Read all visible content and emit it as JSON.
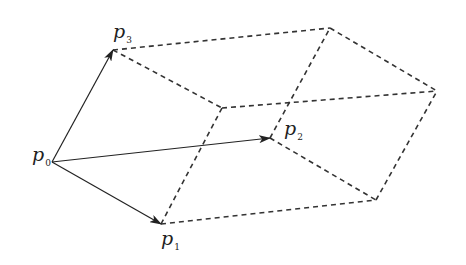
{
  "diagram": {
    "title": "",
    "colors": {
      "line": "#222222",
      "dashed": "#333333",
      "background": "#ffffff"
    },
    "points": {
      "p0": {
        "x": 52,
        "y": 162
      },
      "p1": {
        "x": 161,
        "y": 224
      },
      "p2": {
        "x": 270,
        "y": 138
      },
      "p3": {
        "x": 113,
        "y": 50
      },
      "p1p3": {
        "x": 222,
        "y": 108
      },
      "p2p3": {
        "x": 330,
        "y": 28
      },
      "p1p2p3": {
        "x": 437,
        "y": 91
      },
      "p1p2": {
        "x": 376,
        "y": 200
      }
    },
    "labels": [
      {
        "id": "p0",
        "base": "p",
        "sub": "0",
        "x": 32,
        "y": 145
      },
      {
        "id": "p1",
        "base": "p",
        "sub": "1",
        "x": 161,
        "y": 229
      },
      {
        "id": "p2",
        "base": "p",
        "sub": "2",
        "x": 284,
        "y": 119
      },
      {
        "id": "p3",
        "base": "p",
        "sub": "3",
        "x": 113,
        "y": 22
      }
    ],
    "solid_arrows": [
      {
        "from": "p0",
        "to": "p1"
      },
      {
        "from": "p0",
        "to": "p2"
      },
      {
        "from": "p0",
        "to": "p3"
      }
    ],
    "dashed_edges": [
      {
        "from": "p3",
        "to": "p2p3"
      },
      {
        "from": "p3",
        "to": "p1p3"
      },
      {
        "from": "p1",
        "to": "p1p3"
      },
      {
        "from": "p1",
        "to": "p1p2"
      },
      {
        "from": "p2",
        "to": "p2p3"
      },
      {
        "from": "p2",
        "to": "p1p2"
      },
      {
        "from": "p1p3",
        "to": "p1p2p3"
      },
      {
        "from": "p2p3",
        "to": "p1p2p3"
      },
      {
        "from": "p1p2",
        "to": "p1p2p3"
      }
    ]
  }
}
